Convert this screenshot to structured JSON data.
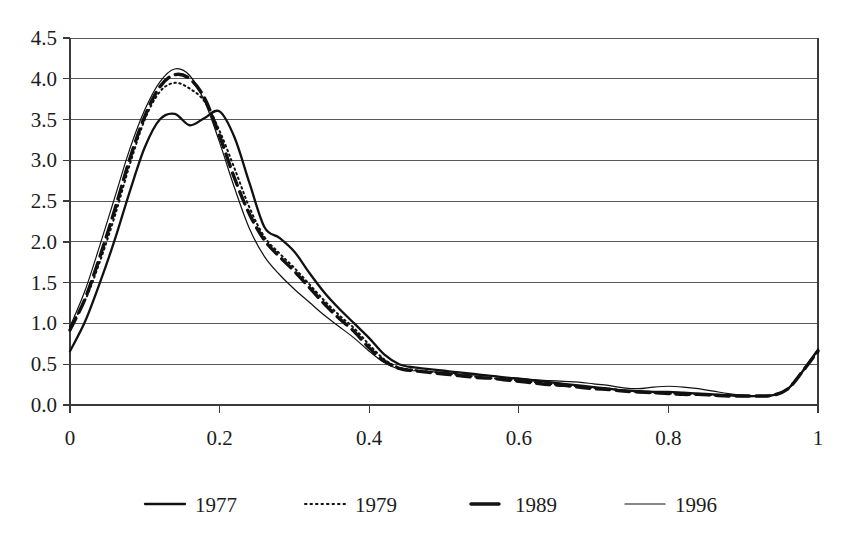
{
  "chart_data": {
    "type": "line",
    "title": "",
    "subtitle": "",
    "xlabel": "",
    "ylabel": "",
    "xlim": [
      0,
      1
    ],
    "ylim": [
      0,
      4.5
    ],
    "grid": true,
    "legend_position": "bottom",
    "y_ticks": [
      "0.0",
      "0.5",
      "1.0",
      "1.5",
      "2.0",
      "2.5",
      "3.0",
      "3.5",
      "4.0",
      "4.5"
    ],
    "y_tick_values": [
      0.0,
      0.5,
      1.0,
      1.5,
      2.0,
      2.5,
      3.0,
      3.5,
      4.0,
      4.5
    ],
    "x_ticks": [
      "0",
      "0.2",
      "0.4",
      "0.6",
      "0.8",
      "1"
    ],
    "x_tick_values": [
      0,
      0.2,
      0.4,
      0.6,
      0.8,
      1.0
    ],
    "x": [
      0.0,
      0.02,
      0.04,
      0.06,
      0.08,
      0.1,
      0.12,
      0.14,
      0.16,
      0.18,
      0.2,
      0.22,
      0.24,
      0.26,
      0.28,
      0.3,
      0.32,
      0.34,
      0.36,
      0.38,
      0.4,
      0.42,
      0.44,
      0.46,
      0.48,
      0.5,
      0.52,
      0.54,
      0.56,
      0.58,
      0.6,
      0.62,
      0.64,
      0.66,
      0.68,
      0.7,
      0.72,
      0.74,
      0.76,
      0.78,
      0.8,
      0.82,
      0.84,
      0.86,
      0.88,
      0.9,
      0.92,
      0.94,
      0.96,
      0.98,
      1.0
    ],
    "series": [
      {
        "name": "1977",
        "style": "solid",
        "stroke_width": 2.3,
        "dash": "none",
        "color": "#111111",
        "values": [
          0.66,
          1.02,
          1.5,
          2.03,
          2.62,
          3.16,
          3.5,
          3.57,
          3.43,
          3.52,
          3.6,
          3.28,
          2.72,
          2.18,
          2.05,
          1.88,
          1.62,
          1.38,
          1.18,
          1.0,
          0.82,
          0.62,
          0.5,
          0.46,
          0.44,
          0.42,
          0.4,
          0.38,
          0.36,
          0.34,
          0.32,
          0.3,
          0.28,
          0.26,
          0.24,
          0.22,
          0.2,
          0.18,
          0.17,
          0.16,
          0.16,
          0.15,
          0.14,
          0.13,
          0.12,
          0.11,
          0.11,
          0.12,
          0.2,
          0.42,
          0.68
        ]
      },
      {
        "name": "1979",
        "style": "dotted",
        "stroke_width": 2.0,
        "dash": "1.5,3.5",
        "color": "#111111",
        "values": [
          0.96,
          1.28,
          1.76,
          2.32,
          2.95,
          3.5,
          3.84,
          3.95,
          3.88,
          3.72,
          3.36,
          2.9,
          2.42,
          2.06,
          1.86,
          1.68,
          1.48,
          1.28,
          1.1,
          0.94,
          0.74,
          0.56,
          0.46,
          0.43,
          0.41,
          0.39,
          0.37,
          0.35,
          0.33,
          0.32,
          0.3,
          0.28,
          0.26,
          0.24,
          0.23,
          0.21,
          0.2,
          0.18,
          0.16,
          0.15,
          0.14,
          0.14,
          0.13,
          0.12,
          0.12,
          0.11,
          0.11,
          0.12,
          0.2,
          0.42,
          0.66
        ]
      },
      {
        "name": "1989",
        "style": "dashed",
        "stroke_width": 3.4,
        "dash": "13,7",
        "color": "#111111",
        "values": [
          0.92,
          1.3,
          1.82,
          2.4,
          3.02,
          3.54,
          3.9,
          4.05,
          4.0,
          3.76,
          3.3,
          2.78,
          2.34,
          2.02,
          1.82,
          1.64,
          1.44,
          1.24,
          1.06,
          0.9,
          0.7,
          0.54,
          0.45,
          0.42,
          0.4,
          0.38,
          0.36,
          0.34,
          0.33,
          0.31,
          0.29,
          0.27,
          0.25,
          0.24,
          0.22,
          0.2,
          0.19,
          0.17,
          0.16,
          0.15,
          0.14,
          0.13,
          0.13,
          0.12,
          0.11,
          0.11,
          0.11,
          0.12,
          0.2,
          0.42,
          0.66
        ]
      },
      {
        "name": "1996",
        "style": "thin-solid",
        "stroke_width": 1.2,
        "dash": "none",
        "color": "#111111",
        "values": [
          0.96,
          1.4,
          1.96,
          2.55,
          3.14,
          3.62,
          3.96,
          4.12,
          4.04,
          3.72,
          3.22,
          2.66,
          2.16,
          1.82,
          1.6,
          1.42,
          1.26,
          1.1,
          0.96,
          0.82,
          0.66,
          0.52,
          0.44,
          0.42,
          0.41,
          0.4,
          0.38,
          0.37,
          0.36,
          0.34,
          0.33,
          0.31,
          0.3,
          0.29,
          0.28,
          0.26,
          0.24,
          0.21,
          0.2,
          0.22,
          0.23,
          0.22,
          0.2,
          0.17,
          0.14,
          0.12,
          0.11,
          0.12,
          0.2,
          0.42,
          0.68
        ]
      }
    ],
    "legend": [
      {
        "label": "1977",
        "style": "solid"
      },
      {
        "label": "1979",
        "style": "dotted"
      },
      {
        "label": "1989",
        "style": "dashed"
      },
      {
        "label": "1996",
        "style": "thin-solid"
      }
    ]
  },
  "geometry": {
    "plot_left": 70,
    "plot_right": 818,
    "plot_top": 38,
    "plot_bottom": 405,
    "legend_y": 504,
    "legend_xs": [
      145,
      305,
      465,
      625
    ]
  }
}
